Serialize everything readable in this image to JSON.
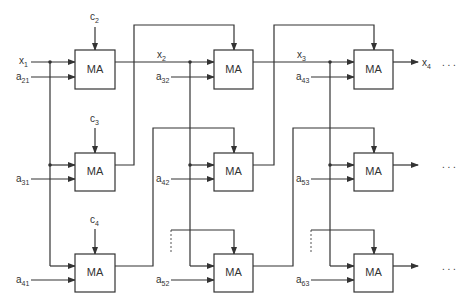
{
  "diagram": {
    "type": "systolic-array",
    "cell_label": "MA",
    "ellipsis": ". . .",
    "inputs_top": [
      {
        "name": "c",
        "sub": "2"
      },
      {
        "name": "c",
        "sub": "3"
      },
      {
        "name": "c",
        "sub": "4"
      }
    ],
    "x_labels": [
      {
        "name": "x",
        "sub": "1"
      },
      {
        "name": "x",
        "sub": "2"
      },
      {
        "name": "x",
        "sub": "3"
      },
      {
        "name": "x",
        "sub": "4"
      }
    ],
    "a_labels": {
      "row1": [
        {
          "name": "a",
          "sub": "21"
        },
        {
          "name": "a",
          "sub": "32"
        },
        {
          "name": "a",
          "sub": "43"
        }
      ],
      "row2": [
        {
          "name": "a",
          "sub": "31"
        },
        {
          "name": "a",
          "sub": "42"
        },
        {
          "name": "a",
          "sub": "53"
        }
      ],
      "row3": [
        {
          "name": "a",
          "sub": "41"
        },
        {
          "name": "a",
          "sub": "52"
        },
        {
          "name": "a",
          "sub": "63"
        }
      ]
    },
    "rows": 3,
    "columns": 3
  }
}
